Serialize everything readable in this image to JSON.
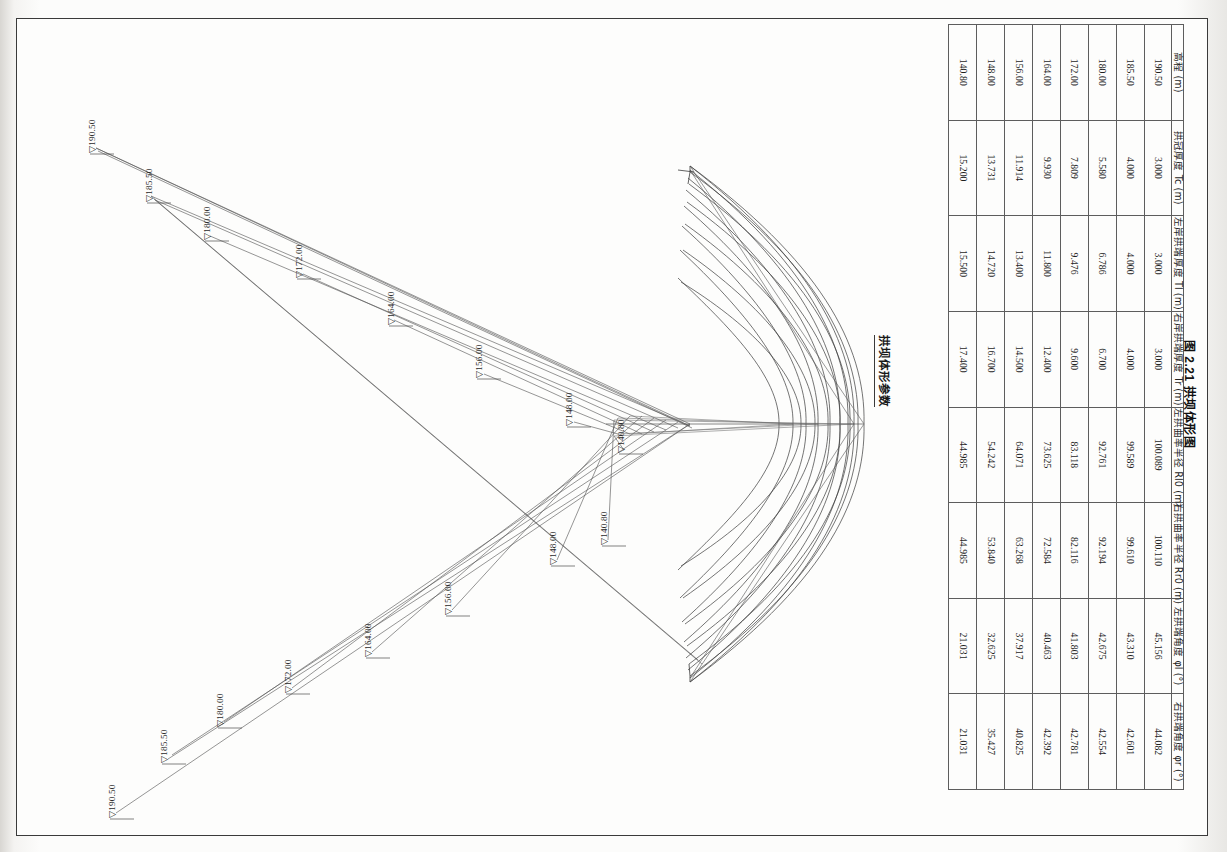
{
  "document": {
    "figure_caption": "图 2.21  拱坝体形图",
    "table_title": "拱坝体形参数"
  },
  "table": {
    "headers": [
      "高程 (m)",
      "拱冠厚度 Tc (m)",
      "左岸拱端厚度 Tl (m)",
      "右岸拱端厚度 Tr (m)",
      "左拱曲率半径 Rl0 (m)",
      "右拱曲率半径 Rr0 (m)",
      "左拱端角度 φl (°)",
      "右拱端角度 φr (°)"
    ],
    "rows": [
      [
        "190.50",
        "3.000",
        "3.000",
        "3.000",
        "100.089",
        "100.110",
        "45.156",
        "44.082"
      ],
      [
        "185.50",
        "4.000",
        "4.000",
        "4.000",
        "99.589",
        "99.610",
        "43.310",
        "42.601"
      ],
      [
        "180.00",
        "5.580",
        "6.786",
        "6.700",
        "92.761",
        "92.194",
        "42.675",
        "42.554"
      ],
      [
        "172.00",
        "7.809",
        "9.476",
        "9.600",
        "83.118",
        "82.116",
        "41.803",
        "42.781"
      ],
      [
        "164.00",
        "9.930",
        "11.800",
        "12.400",
        "73.625",
        "72.584",
        "40.463",
        "42.392"
      ],
      [
        "156.00",
        "11.914",
        "13.400",
        "14.500",
        "64.071",
        "63.268",
        "37.917",
        "40.825"
      ],
      [
        "148.00",
        "13.731",
        "14.720",
        "16.700",
        "54.242",
        "53.840",
        "32.625",
        "35.427"
      ],
      [
        "140.80",
        "15.200",
        "15.500",
        "17.400",
        "44.985",
        "44.985",
        "21.031",
        "21.031"
      ]
    ]
  },
  "drawing": {
    "name": "arch-dam-plan-view",
    "elevation_markers": [
      {
        "id": "upper-190-50",
        "label": "▽190.50",
        "x": 68,
        "y": 133
      },
      {
        "id": "upper-185-50",
        "label": "▽185.50",
        "x": 125,
        "y": 182
      },
      {
        "id": "upper-180-00",
        "label": "▽180.00",
        "x": 183,
        "y": 220
      },
      {
        "id": "upper-172-00",
        "label": "▽172.00",
        "x": 275,
        "y": 258
      },
      {
        "id": "upper-164-00",
        "label": "▽164.00",
        "x": 367,
        "y": 305
      },
      {
        "id": "upper-156-00",
        "label": "▽156.00",
        "x": 455,
        "y": 358
      },
      {
        "id": "upper-148-00",
        "label": "▽148.00",
        "x": 545,
        "y": 406
      },
      {
        "id": "upper-140-80",
        "label": "▽140.80",
        "x": 597,
        "y": 433
      },
      {
        "id": "lower-190-50",
        "label": "▽190.50",
        "x": 88,
        "y": 798
      },
      {
        "id": "lower-185-50",
        "label": "▽185.50",
        "x": 140,
        "y": 743
      },
      {
        "id": "lower-180-00",
        "label": "▽180.00",
        "x": 196,
        "y": 707
      },
      {
        "id": "lower-172-00",
        "label": "▽172.00",
        "x": 264,
        "y": 673
      },
      {
        "id": "lower-164-00",
        "label": "▽164.00",
        "x": 344,
        "y": 637
      },
      {
        "id": "lower-156-00",
        "label": "▽156.00",
        "x": 424,
        "y": 595
      },
      {
        "id": "lower-148-00",
        "label": "▽148.00",
        "x": 529,
        "y": 545
      },
      {
        "id": "lower-140-80",
        "label": "▽140.80",
        "x": 580,
        "y": 525
      }
    ]
  }
}
